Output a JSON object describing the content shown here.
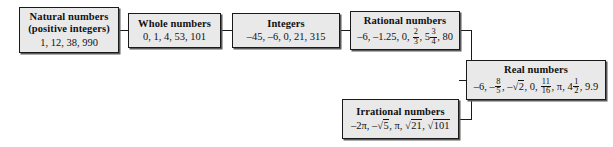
{
  "diagram": {
    "style": {
      "box_fill": "#e9e9e9",
      "box_border": "#1a1a1a",
      "shadow": "#5a5a5a",
      "text": "#111111",
      "background": "#ffffff"
    }
  },
  "boxes": {
    "natural": {
      "title_line1": "Natural numbers",
      "title_line2": "(positive integers)",
      "examples": "1, 12, 38, 990"
    },
    "whole": {
      "title": "Whole numbers",
      "examples": "0, 1, 4, 53, 101"
    },
    "integers": {
      "title": "Integers",
      "examples": "–45, –6, 0, 21, 315"
    },
    "rational": {
      "title": "Rational numbers",
      "examples_prefix": "–6, –1.25, 0, ",
      "frac1_num": "2",
      "frac1_den": "3",
      "examples_mid": ", 5",
      "frac2_num": "3",
      "frac2_den": "4",
      "examples_suffix": ", 80",
      "examples_plain": "–6, –1.25, 0, 2/3, 5 3/4, 80"
    },
    "irrational": {
      "title": "Irrational numbers",
      "examples_prefix": "–2π, –",
      "radical1": "5",
      "examples_mid": ", π, ",
      "radical2": "21",
      "examples_mid2": ", ",
      "radical3": "101",
      "examples_plain": "–2π, –√5, π, √21, √101"
    },
    "real": {
      "title": "Real numbers",
      "examples_p1": "–6, –",
      "frac1_num": "8",
      "frac1_den": "5",
      "examples_p2": ", –",
      "radical1": "2",
      "examples_p3": ", 0, ",
      "frac2_num": "11",
      "frac2_den": "16",
      "examples_p4": ", π, 4",
      "frac3_num": "1",
      "frac3_den": "2",
      "examples_p5": ", 9.9",
      "examples_plain": "–6, –8/5, –√2, 0, 11/16, π, 4 1/2, 9.9"
    }
  },
  "connectors": [
    {
      "name": "natural-to-whole",
      "from": "natural",
      "to": "whole"
    },
    {
      "name": "whole-to-integers",
      "from": "whole",
      "to": "integers"
    },
    {
      "name": "integers-to-rational",
      "from": "integers",
      "to": "rational"
    },
    {
      "name": "rational-to-real",
      "from": "rational",
      "to": "real"
    },
    {
      "name": "irrational-to-real",
      "from": "irrational",
      "to": "real"
    }
  ]
}
